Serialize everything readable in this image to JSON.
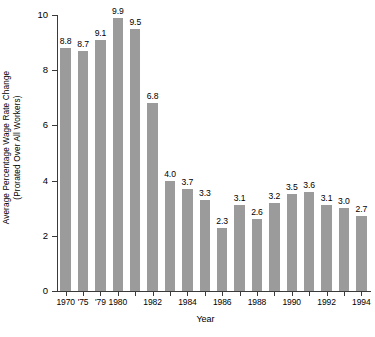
{
  "chart_data": {
    "type": "bar",
    "title": "",
    "xlabel": "Year",
    "ylabel_line1": "Average Percentage  Wage Rate Change",
    "ylabel_line2": "(Prorated Over All Workers)",
    "ylim": [
      0,
      10
    ],
    "ytick_values": [
      0,
      2,
      4,
      6,
      8,
      10
    ],
    "ytick_labels": [
      "0",
      "2",
      "4",
      "6",
      "8",
      "10"
    ],
    "grid": false,
    "legend": null,
    "bar_color": "#9b9b9b",
    "axis_color": "#3a3a3a",
    "categories": [
      "1970",
      "1975",
      "1979",
      "1980",
      "1981",
      "1982",
      "1983",
      "1984",
      "1985",
      "1986",
      "1987",
      "1988",
      "1989",
      "1990",
      "1991",
      "1992",
      "1993",
      "1994"
    ],
    "values": [
      8.8,
      8.7,
      9.1,
      9.9,
      9.5,
      6.8,
      4.0,
      3.7,
      3.3,
      2.3,
      3.1,
      2.6,
      3.2,
      3.5,
      3.6,
      3.1,
      3.0,
      2.7
    ],
    "bar_labels": [
      "8.8",
      "8.7",
      "9.1",
      "9.9",
      "9.5",
      "6.8",
      "4.0",
      "3.7",
      "3.3",
      "2.3",
      "3.1",
      "2.6",
      "3.2",
      "3.5",
      "3.6",
      "3.1",
      "3.0",
      "2.7"
    ],
    "xtick_labels": [
      "1970",
      "'75",
      "'79",
      "1980",
      "1982",
      "1984",
      "1986",
      "1988",
      "1990",
      "1992",
      "1994"
    ],
    "xtick_category_index": [
      0,
      1,
      2,
      3,
      5,
      7,
      9,
      11,
      13,
      15,
      17
    ]
  }
}
